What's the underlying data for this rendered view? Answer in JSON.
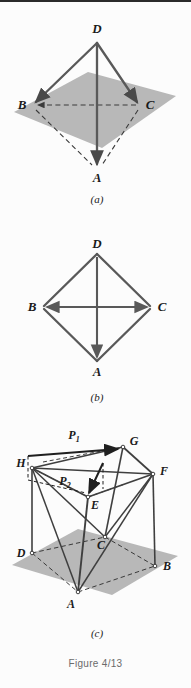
{
  "figure": {
    "caption": "Figure 4/13",
    "background_color": "#fcfcfc",
    "plane_color": "#b8b8b8",
    "line_color": "#4a4a4a",
    "dash_color": "#3a3a3a"
  },
  "panels": [
    {
      "id": "a",
      "sublabel": "(a)",
      "description": "tetrahedron on inclined plane",
      "vertices": [
        {
          "name": "D",
          "label": "D",
          "x": 97,
          "y": 40
        },
        {
          "name": "B",
          "label": "B",
          "x": 32,
          "y": 105
        },
        {
          "name": "C",
          "label": "C",
          "x": 140,
          "y": 105
        },
        {
          "name": "A",
          "label": "A",
          "x": 97,
          "y": 170
        }
      ],
      "solid_edges": [
        "D-B",
        "D-C",
        "D-A"
      ],
      "dashed_edges": [
        "B-C",
        "B-A",
        "A-C"
      ]
    },
    {
      "id": "b",
      "sublabel": "(b)",
      "description": "planar rhombus with diagonals",
      "vertices": [
        {
          "name": "D",
          "label": "D",
          "x": 97,
          "y": 252
        },
        {
          "name": "B",
          "label": "B",
          "x": 42,
          "y": 307
        },
        {
          "name": "C",
          "label": "C",
          "x": 152,
          "y": 307
        },
        {
          "name": "A",
          "label": "A",
          "x": 97,
          "y": 362
        }
      ],
      "solid_edges": [
        "D-B",
        "D-C",
        "B-A",
        "C-A",
        "B-C",
        "D-A"
      ],
      "dashed_edges": []
    },
    {
      "id": "c",
      "sublabel": "(c)",
      "description": "rectangular box with applied forces",
      "vertices": [
        {
          "name": "G",
          "label": "G",
          "x": 123,
          "y": 447
        },
        {
          "name": "H",
          "label": "H",
          "x": 32,
          "y": 468
        },
        {
          "name": "F",
          "label": "F",
          "x": 153,
          "y": 474
        },
        {
          "name": "E",
          "label": "E",
          "x": 88,
          "y": 497
        },
        {
          "name": "C",
          "label": "C",
          "x": 105,
          "y": 537
        },
        {
          "name": "D",
          "label": "D",
          "x": 32,
          "y": 553
        },
        {
          "name": "B",
          "label": "B",
          "x": 155,
          "y": 566
        },
        {
          "name": "A",
          "label": "A",
          "x": 78,
          "y": 592
        }
      ],
      "forces": [
        {
          "name": "P1",
          "label": "P",
          "subscript": "1",
          "label_x": 74,
          "label_y": 435,
          "from_x": 53,
          "from_y": 456,
          "to_x": 120,
          "to_y": 449
        },
        {
          "name": "P2",
          "label": "P",
          "subscript": "2",
          "label_x": 68,
          "label_y": 482,
          "from_x": 103,
          "from_y": 463,
          "to_x": 88,
          "to_y": 494
        }
      ],
      "solid_edges": [
        "H-G",
        "G-F",
        "H-E",
        "E-F",
        "H-D",
        "G-C",
        "F-B",
        "E-A",
        "H-A",
        "F-A",
        "H-C",
        "F-C",
        "H-F"
      ],
      "dashed_edges": [
        "D-A",
        "A-B",
        "D-C",
        "C-B",
        "H-dash-G"
      ]
    }
  ]
}
